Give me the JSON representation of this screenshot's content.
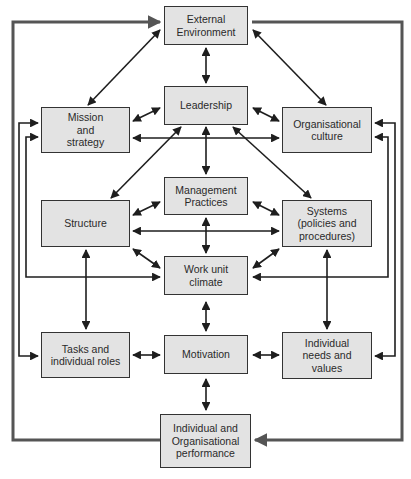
{
  "diagram": {
    "colors": {
      "box_fill": "#e3e3e3",
      "box_border": "#333333",
      "arrow": "#1e1e1e",
      "feedback_arrow": "#555555",
      "text": "#2a2a2a"
    },
    "nodes": {
      "external_environment": "External\nEnvironment",
      "leadership": "Leadership",
      "mission_strategy": "Mission\nand\nstrategy",
      "organisational_culture": "Organisational\nculture",
      "management_practices": "Management\nPractices",
      "structure": "Structure",
      "systems": "Systems\n(policies and\nprocedures)",
      "work_unit_climate": "Work unit\nclimate",
      "tasks_roles": "Tasks and\nindividual roles",
      "motivation": "Motivation",
      "individual_needs": "Individual\nneeds and\nvalues",
      "performance": "Individual and\nOrganisational\nperformance"
    },
    "edges": [
      {
        "from": "External Environment",
        "to": "Leadership",
        "type": "bidirectional"
      },
      {
        "from": "External Environment",
        "to": "Mission and strategy",
        "type": "bidirectional"
      },
      {
        "from": "External Environment",
        "to": "Organisational culture",
        "type": "bidirectional"
      },
      {
        "from": "Leadership",
        "to": "Mission and strategy",
        "type": "bidirectional"
      },
      {
        "from": "Leadership",
        "to": "Organisational culture",
        "type": "bidirectional"
      },
      {
        "from": "Mission and strategy",
        "to": "Organisational culture",
        "type": "bidirectional"
      },
      {
        "from": "Leadership",
        "to": "Structure",
        "type": "bidirectional"
      },
      {
        "from": "Leadership",
        "to": "Management Practices",
        "type": "bidirectional"
      },
      {
        "from": "Leadership",
        "to": "Systems",
        "type": "bidirectional"
      },
      {
        "from": "Management Practices",
        "to": "Structure",
        "type": "bidirectional"
      },
      {
        "from": "Management Practices",
        "to": "Systems",
        "type": "bidirectional"
      },
      {
        "from": "Structure",
        "to": "Systems",
        "type": "bidirectional"
      },
      {
        "from": "Management Practices",
        "to": "Work unit climate",
        "type": "bidirectional"
      },
      {
        "from": "Structure",
        "to": "Work unit climate",
        "type": "bidirectional"
      },
      {
        "from": "Systems",
        "to": "Work unit climate",
        "type": "bidirectional"
      },
      {
        "from": "Mission and strategy",
        "to": "Work unit climate",
        "type": "bidirectional"
      },
      {
        "from": "Organisational culture",
        "to": "Work unit climate",
        "type": "bidirectional"
      },
      {
        "from": "Structure",
        "to": "Tasks and individual roles",
        "type": "bidirectional"
      },
      {
        "from": "Systems",
        "to": "Individual needs and values",
        "type": "bidirectional"
      },
      {
        "from": "Mission and strategy",
        "to": "Tasks and individual roles",
        "type": "bidirectional"
      },
      {
        "from": "Organisational culture",
        "to": "Individual needs and values",
        "type": "bidirectional"
      },
      {
        "from": "Work unit climate",
        "to": "Motivation",
        "type": "bidirectional"
      },
      {
        "from": "Tasks and individual roles",
        "to": "Motivation",
        "type": "bidirectional"
      },
      {
        "from": "Individual needs and values",
        "to": "Motivation",
        "type": "bidirectional"
      },
      {
        "from": "Motivation",
        "to": "Individual and Organisational performance",
        "type": "bidirectional"
      },
      {
        "from": "Individual and Organisational performance",
        "to": "External Environment",
        "type": "feedback"
      },
      {
        "from": "External Environment",
        "to": "Individual and Organisational performance",
        "type": "feedback"
      }
    ]
  }
}
